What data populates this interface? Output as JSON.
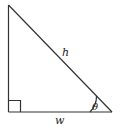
{
  "diagram": {
    "type": "right-triangle",
    "labels": {
      "hypotenuse": "h",
      "base": "w",
      "angle": "θ"
    },
    "right_angle_marker": "square",
    "colors": {
      "stroke": "#333333",
      "background": "#ffffff"
    }
  }
}
